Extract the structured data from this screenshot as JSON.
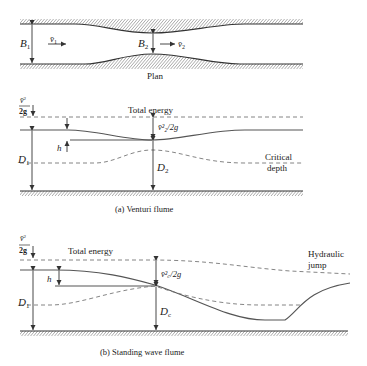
{
  "plan": {
    "label": "Plan",
    "B1": "B",
    "B1_sub": "1",
    "B2": "B",
    "B2_sub": "2",
    "v1": "v̄",
    "v1_sub": "1",
    "v2": "v̄",
    "v2_sub": "2"
  },
  "venturi": {
    "caption": "(a) Venturi flume",
    "total_energy": "Total energy",
    "velocity_head_1_num": "v̄",
    "velocity_head_1_sup": "2",
    "velocity_head_1_subs": "1",
    "velocity_head_1_den": "2g",
    "velocity_head_2": "v̄²₂/2g",
    "h": "h",
    "D1": "D",
    "D1_sub": "1",
    "D2": "D",
    "D2_sub": "2",
    "critical_1": "Critical",
    "critical_2": "depth"
  },
  "standing_wave": {
    "caption": "(b) Standing wave flume",
    "total_energy": "Total energy",
    "velocity_head_1_num": "v̄",
    "velocity_head_1_sup": "2",
    "velocity_head_1_subs": "1",
    "velocity_head_1_den": "2g",
    "velocity_head_c": "v̄²꜀/2g",
    "h": "h",
    "D1": "D",
    "D1_sub": "1",
    "Dc": "D",
    "Dc_sub": "c",
    "hydraulic_1": "Hydraulic",
    "hydraulic_2": "jump"
  }
}
